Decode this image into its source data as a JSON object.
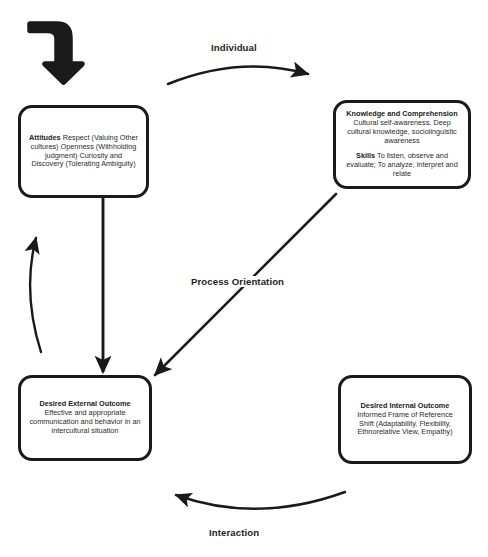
{
  "diagram": {
    "background_color": "#ffffff",
    "line_color": "#1a1a1a",
    "text_color": "#2b2b2b",
    "nodes": {
      "attitudes": {
        "heading": "Attitudes",
        "body": " Respect (Valuing Other cultures) Openness (Withholding judgment) Curiosity and Discovery (Tolerating Ambiguity)"
      },
      "knowledge": {
        "heading": "Knowledge and Comprehension",
        "body": "Cultural self-awareness. Deep cultural knowledge, sociolinguistic awareness",
        "heading2": "Skills",
        "body2": " To listen, observe and evaluate; To analyze, interpret and relate"
      },
      "external_outcome": {
        "heading": "Desired External Outcome",
        "body": "Effective and appropriate communication and behavior in an intercultural situation"
      },
      "internal_outcome": {
        "heading": "Desired Internal Outcome",
        "body": "Informed Frame of Reference Shift (Adaptability, Flexibility, Ethnorelative View, Empathy)"
      }
    },
    "edge_labels": {
      "individual": "Individual",
      "process_orientation": "Process Orientation",
      "interaction": "Interaction"
    },
    "arrows": [
      {
        "name": "entry-elbow-arrow",
        "from": "start",
        "to": "attitudes",
        "style": "thick-elbow"
      },
      {
        "name": "individual-arc-arrow",
        "from": "attitudes",
        "to": "knowledge",
        "style": "curved"
      },
      {
        "name": "process-orientation-arrow",
        "from": "knowledge",
        "to": "external-outcome",
        "style": "straight-diagonal"
      },
      {
        "name": "attitudes-to-external-arrow",
        "from": "attitudes",
        "to": "external-outcome",
        "style": "straight-vertical"
      },
      {
        "name": "external-to-attitudes-arrow",
        "from": "external-outcome",
        "to": "attitudes",
        "style": "curved"
      },
      {
        "name": "interaction-arc-arrow",
        "from": "internal-outcome",
        "to": "external-outcome",
        "style": "curved"
      }
    ]
  }
}
